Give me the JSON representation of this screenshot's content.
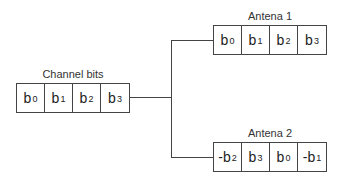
{
  "source": {
    "label": "Channel bits",
    "bits": [
      {
        "base": "b",
        "sub": "0"
      },
      {
        "base": "b",
        "sub": "1"
      },
      {
        "base": "b",
        "sub": "2"
      },
      {
        "base": "b",
        "sub": "3"
      }
    ]
  },
  "antenna1": {
    "label": "Antena 1",
    "bits": [
      {
        "base": "b",
        "sub": "0"
      },
      {
        "base": "b",
        "sub": "1"
      },
      {
        "base": "b",
        "sub": "2"
      },
      {
        "base": "b",
        "sub": "3"
      }
    ]
  },
  "antenna2": {
    "label": "Antena 2",
    "bits": [
      {
        "base": "-b",
        "sub": "2"
      },
      {
        "base": "b",
        "sub": "3"
      },
      {
        "base": "b",
        "sub": "0"
      },
      {
        "base": "-b",
        "sub": "1"
      }
    ]
  }
}
